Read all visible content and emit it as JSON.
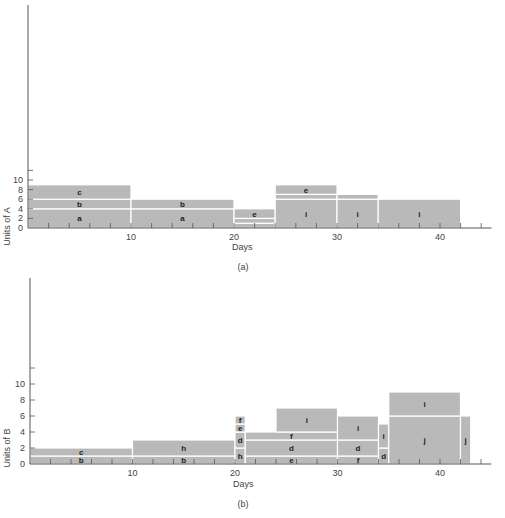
{
  "chart_data": [
    {
      "type": "bar",
      "subtype": "stacked-resource-histogram",
      "caption": "(a)",
      "title": "",
      "xlabel": "Days",
      "ylabel": "Units of A",
      "xlim": [
        0,
        45
      ],
      "ylim": [
        0,
        12
      ],
      "x_ticks": [
        10,
        20,
        30,
        40
      ],
      "y_ticks": [
        0,
        2,
        4,
        6,
        8,
        10
      ],
      "grid": false,
      "legend": null,
      "blocks": [
        {
          "activity": "a",
          "x0": 0,
          "x1": 10,
          "y0": 0,
          "y1": 4
        },
        {
          "activity": "b",
          "x0": 0,
          "x1": 10,
          "y0": 4,
          "y1": 6
        },
        {
          "activity": "c",
          "x0": 0,
          "x1": 10,
          "y0": 6,
          "y1": 9
        },
        {
          "activity": "a",
          "x0": 10,
          "x1": 20,
          "y0": 0,
          "y1": 4
        },
        {
          "activity": "b",
          "x0": 10,
          "x1": 20,
          "y0": 4,
          "y1": 6
        },
        {
          "activity": "g",
          "x0": 20,
          "x1": 24,
          "y0": 0,
          "y1": 1
        },
        {
          "activity": "f",
          "x0": 20,
          "x1": 24,
          "y0": 1,
          "y1": 2
        },
        {
          "activity": "e",
          "x0": 20,
          "x1": 24,
          "y0": 2,
          "y1": 4
        },
        {
          "activity": "i",
          "x0": 24,
          "x1": 30,
          "y0": 0,
          "y1": 6
        },
        {
          "activity": "f",
          "x0": 24,
          "x1": 30,
          "y0": 6,
          "y1": 7
        },
        {
          "activity": "e",
          "x0": 24,
          "x1": 30,
          "y0": 7,
          "y1": 9
        },
        {
          "activity": "i",
          "x0": 30,
          "x1": 34,
          "y0": 0,
          "y1": 6
        },
        {
          "activity": "f",
          "x0": 30,
          "x1": 34,
          "y0": 6,
          "y1": 7
        },
        {
          "activity": "i",
          "x0": 34,
          "x1": 42,
          "y0": 0,
          "y1": 6
        }
      ]
    },
    {
      "type": "bar",
      "subtype": "stacked-resource-histogram",
      "caption": "(b)",
      "title": "",
      "xlabel": "Days",
      "ylabel": "Units of B",
      "xlim": [
        0,
        45
      ],
      "ylim": [
        0,
        12
      ],
      "x_ticks": [
        10,
        20,
        30,
        40
      ],
      "y_ticks": [
        0,
        2,
        4,
        6,
        8,
        10
      ],
      "grid": false,
      "legend": null,
      "blocks": [
        {
          "activity": "b",
          "x0": 0,
          "x1": 10,
          "y0": 0,
          "y1": 1
        },
        {
          "activity": "c",
          "x0": 0,
          "x1": 10,
          "y0": 1,
          "y1": 2
        },
        {
          "activity": "b",
          "x0": 10,
          "x1": 20,
          "y0": 0,
          "y1": 1
        },
        {
          "activity": "h",
          "x0": 10,
          "x1": 20,
          "y0": 1,
          "y1": 3
        },
        {
          "activity": "h",
          "x0": 20,
          "x1": 21,
          "y0": 0,
          "y1": 2
        },
        {
          "activity": "d",
          "x0": 20,
          "x1": 21,
          "y0": 2,
          "y1": 4
        },
        {
          "activity": "e",
          "x0": 20,
          "x1": 21,
          "y0": 4,
          "y1": 5
        },
        {
          "activity": "f",
          "x0": 20,
          "x1": 21,
          "y0": 5,
          "y1": 6
        },
        {
          "activity": "e",
          "x0": 21,
          "x1": 30,
          "y0": 0,
          "y1": 1
        },
        {
          "activity": "d",
          "x0": 21,
          "x1": 30,
          "y0": 1,
          "y1": 3
        },
        {
          "activity": "f",
          "x0": 21,
          "x1": 30,
          "y0": 3,
          "y1": 4
        },
        {
          "activity": "i",
          "x0": 24,
          "x1": 30,
          "y0": 4,
          "y1": 7
        },
        {
          "activity": "f",
          "x0": 30,
          "x1": 34,
          "y0": 0,
          "y1": 1
        },
        {
          "activity": "d",
          "x0": 30,
          "x1": 34,
          "y0": 1,
          "y1": 3
        },
        {
          "activity": "i",
          "x0": 30,
          "x1": 34,
          "y0": 3,
          "y1": 6
        },
        {
          "activity": "d",
          "x0": 34,
          "x1": 35,
          "y0": 0,
          "y1": 2
        },
        {
          "activity": "i",
          "x0": 34,
          "x1": 35,
          "y0": 2,
          "y1": 5
        },
        {
          "activity": "j",
          "x0": 35,
          "x1": 42,
          "y0": 0,
          "y1": 6
        },
        {
          "activity": "i",
          "x0": 35,
          "x1": 42,
          "y0": 6,
          "y1": 9
        },
        {
          "activity": "j",
          "x0": 42,
          "x1": 43,
          "y0": 0,
          "y1": 6
        }
      ]
    }
  ],
  "style": {
    "block_fill": "#b9b9b9",
    "divider_color": "#ffffff",
    "axis_color": "#555555",
    "text_color": "#222222"
  }
}
